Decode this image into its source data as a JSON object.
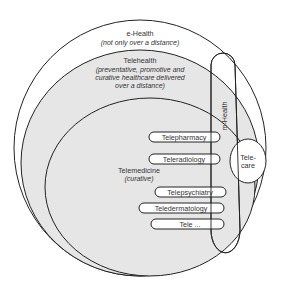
{
  "colors": {
    "background": "#ffffff",
    "shaded_fill": "#e6e6e6",
    "stroke": "#222222",
    "text": "#333333",
    "box_fill": "#ffffff"
  },
  "ehealth": {
    "title": "e-Health",
    "subtitle": "(not only over a distance)"
  },
  "telehealth": {
    "title": "Telehealth",
    "subtitle_lines": [
      "(preventative, promotive and",
      "curative healthcare delivered",
      "over a distance)"
    ]
  },
  "telemedicine": {
    "title": "Telemedicine",
    "subtitle": "(curative)"
  },
  "mhealth": {
    "label": "m-Health"
  },
  "telecare": {
    "lines": [
      "Tele-",
      "care"
    ]
  },
  "specialties": [
    {
      "label": "Telepharmacy"
    },
    {
      "label": "Teleradiology"
    },
    {
      "label": "Telepsychiatry"
    },
    {
      "label": "Teledermatology"
    },
    {
      "label": "Tele ..."
    }
  ]
}
